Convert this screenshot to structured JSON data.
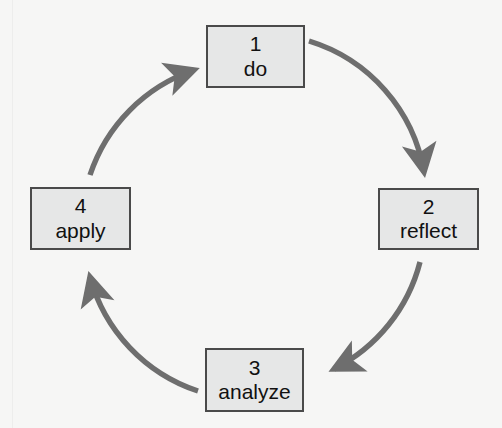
{
  "diagram": {
    "type": "cycle",
    "direction": "clockwise",
    "colors": {
      "background": "#f6f6f5",
      "box_fill": "#e6e7e7",
      "box_border": "#4a4a4a",
      "arrow": "#6e6e6e",
      "text": "#111111"
    },
    "nodes": [
      {
        "id": "do",
        "number": "1",
        "label": "do"
      },
      {
        "id": "reflect",
        "number": "2",
        "label": "reflect"
      },
      {
        "id": "analyze",
        "number": "3",
        "label": "analyze"
      },
      {
        "id": "apply",
        "number": "4",
        "label": "apply"
      }
    ],
    "arrows": [
      {
        "from": "do",
        "to": "reflect"
      },
      {
        "from": "reflect",
        "to": "analyze"
      },
      {
        "from": "analyze",
        "to": "apply"
      },
      {
        "from": "apply",
        "to": "do"
      }
    ]
  }
}
